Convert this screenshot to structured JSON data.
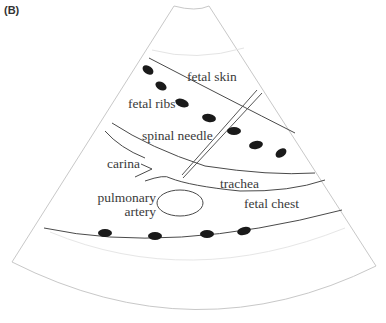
{
  "figure": {
    "panel_label": "(B)",
    "colors": {
      "fan_outline": "#c8c8c8",
      "faint_arc": "#e2e2e2",
      "tissue_line": "#4a4a4a",
      "rib": "#1a1a1a",
      "text": "#3a3a3a"
    }
  },
  "labels": {
    "fetal_skin": "fetal skin",
    "fetal_ribs": "fetal ribs",
    "spinal_needle": "spinal needle",
    "carina": "carina",
    "trachea": "trachea",
    "pulmonary": "pulmonary",
    "artery": "artery",
    "fetal_chest": "fetal chest"
  }
}
